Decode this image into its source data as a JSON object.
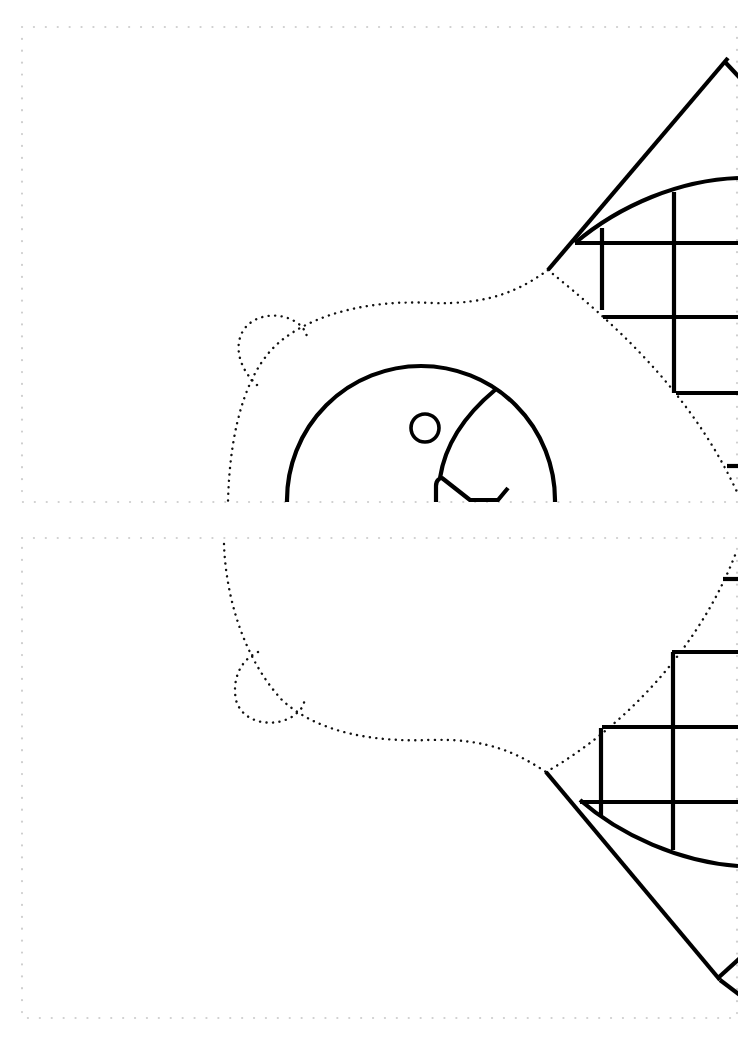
{
  "sheet": {
    "background": "#ffffff",
    "line_color": "#000000",
    "border_color": "#cfcfcf"
  },
  "panels": [
    {
      "name": "top-panel",
      "x": 22,
      "y": 27,
      "width": 715,
      "height": 475
    },
    {
      "name": "bottom-panel",
      "x": 22,
      "y": 538,
      "width": 715,
      "height": 480
    }
  ]
}
